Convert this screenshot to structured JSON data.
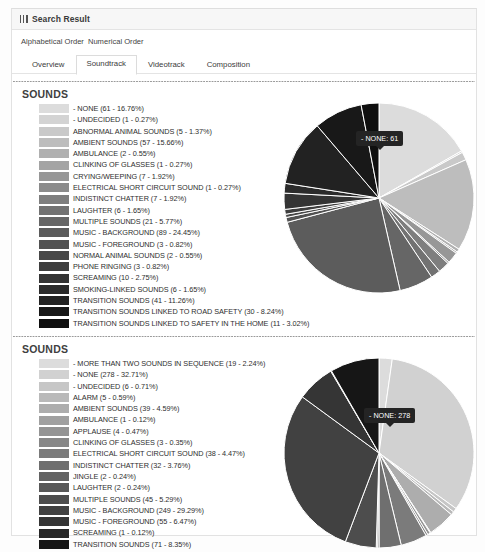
{
  "header": {
    "icon": "grid-icon",
    "title": "Search Result"
  },
  "order_options": [
    {
      "label": "Alphabetical Order"
    },
    {
      "label": "Numerical Order"
    }
  ],
  "tabs": [
    {
      "label": "Overview",
      "active": false
    },
    {
      "label": "Soundtrack",
      "active": true
    },
    {
      "label": "Videotrack",
      "active": false
    },
    {
      "label": "Composition",
      "active": false
    }
  ],
  "sections": [
    {
      "title": "SOUNDS",
      "tooltip": "- NONE: 61",
      "chart_data": {
        "type": "pie",
        "title": "SOUNDS",
        "legend_position": "left",
        "total": 364,
        "categories": [
          "- NONE",
          "- UNDECIDED",
          "ABNORMAL ANIMAL SOUNDS",
          "AMBIENT SOUNDS",
          "AMBULANCE",
          "CLINKING OF GLASSES",
          "CRYING/WEEPING",
          "ELECTRICAL SHORT CIRCUIT SOUND",
          "INDISTINCT CHATTER",
          "LAUGHTER",
          "MULTIPLE SOUNDS",
          "MUSIC - BACKGROUND",
          "MUSIC - FOREGROUND",
          "NORMAL ANIMAL SOUNDS",
          "PHONE RINGING",
          "SCREAMING",
          "SMOKING-LINKED SOUNDS",
          "TRANSITION SOUNDS",
          "TRANSITION SOUNDS LINKED TO ROAD SAFETY",
          "TRANSITION SOUNDS LINKED TO SAFETY IN THE HOME"
        ],
        "values": [
          61,
          1,
          5,
          57,
          2,
          1,
          7,
          1,
          7,
          6,
          21,
          89,
          3,
          2,
          3,
          10,
          6,
          41,
          30,
          11
        ],
        "percents": [
          16.76,
          0.27,
          1.37,
          15.66,
          0.55,
          0.27,
          1.92,
          0.27,
          1.92,
          1.65,
          5.77,
          24.45,
          0.82,
          0.55,
          0.82,
          2.75,
          1.65,
          11.26,
          8.24,
          3.02
        ],
        "colors": [
          "#dcdcdc",
          "#d3d3d3",
          "#c9c9c9",
          "#bdbdbd",
          "#b0b0b0",
          "#a4a4a4",
          "#979797",
          "#8b8b8b",
          "#7e7e7e",
          "#727272",
          "#666666",
          "#5c5c5c",
          "#525252",
          "#484848",
          "#3e3e3e",
          "#343434",
          "#2b2b2b",
          "#222222",
          "#181818",
          "#0f0f0f"
        ]
      },
      "legend": [
        {
          "label": "- NONE (61 - 16.76%)",
          "color": "#dcdcdc"
        },
        {
          "label": "- UNDECIDED (1 - 0.27%)",
          "color": "#d3d3d3"
        },
        {
          "label": "ABNORMAL ANIMAL SOUNDS (5 - 1.37%)",
          "color": "#c9c9c9"
        },
        {
          "label": "AMBIENT SOUNDS (57 - 15.66%)",
          "color": "#bdbdbd"
        },
        {
          "label": "AMBULANCE (2 - 0.55%)",
          "color": "#b0b0b0"
        },
        {
          "label": "CLINKING OF GLASSES (1 - 0.27%)",
          "color": "#a4a4a4"
        },
        {
          "label": "CRYING/WEEPING (7 - 1.92%)",
          "color": "#979797"
        },
        {
          "label": "ELECTRICAL SHORT CIRCUIT SOUND (1 - 0.27%)",
          "color": "#8b8b8b"
        },
        {
          "label": "INDISTINCT CHATTER (7 - 1.92%)",
          "color": "#7e7e7e"
        },
        {
          "label": "LAUGHTER (6 - 1.65%)",
          "color": "#727272"
        },
        {
          "label": "MULTIPLE SOUNDS (21 - 5.77%)",
          "color": "#666666"
        },
        {
          "label": "MUSIC - BACKGROUND (89 - 24.45%)",
          "color": "#5c5c5c"
        },
        {
          "label": "MUSIC - FOREGROUND (3 - 0.82%)",
          "color": "#525252"
        },
        {
          "label": "NORMAL ANIMAL SOUNDS (2 - 0.55%)",
          "color": "#484848"
        },
        {
          "label": "PHONE RINGING (3 - 0.82%)",
          "color": "#3e3e3e"
        },
        {
          "label": "SCREAMING (10 - 2.75%)",
          "color": "#343434"
        },
        {
          "label": "SMOKING-LINKED SOUNDS (6 - 1.65%)",
          "color": "#2b2b2b"
        },
        {
          "label": "TRANSITION SOUNDS (41 - 11.26%)",
          "color": "#222222"
        },
        {
          "label": "TRANSITION SOUNDS LINKED TO ROAD SAFETY (30 - 8.24%)",
          "color": "#181818"
        },
        {
          "label": "TRANSITION SOUNDS LINKED TO SAFETY IN THE HOME (11 - 3.02%)",
          "color": "#0f0f0f"
        }
      ]
    },
    {
      "title": "SOUNDS",
      "tooltip": "- NONE: 278",
      "chart_data": {
        "type": "pie",
        "title": "SOUNDS",
        "legend_position": "left",
        "total": 850,
        "categories": [
          "- MORE THAN TWO SOUNDS IN SEQUENCE",
          "- NONE",
          "- UNDECIDED",
          "ALARM",
          "AMBIENT SOUNDS",
          "AMBULANCE",
          "APPLAUSE",
          "CLINKING OF GLASSES",
          "ELECTRICAL SHORT CIRCUIT SOUND",
          "INDISTINCT CHATTER",
          "JINGLE",
          "LAUGHTER",
          "MULTIPLE SOUNDS",
          "MUSIC - BACKGROUND",
          "MUSIC - FOREGROUND",
          "SCREAMING",
          "TRANSITION SOUNDS"
        ],
        "values": [
          19,
          278,
          6,
          5,
          39,
          1,
          4,
          3,
          38,
          32,
          2,
          2,
          45,
          249,
          55,
          1,
          71
        ],
        "percents": [
          2.24,
          32.71,
          0.71,
          0.59,
          4.59,
          0.12,
          0.47,
          0.35,
          4.47,
          3.76,
          0.24,
          0.24,
          5.29,
          29.29,
          6.47,
          0.12,
          8.35
        ],
        "colors": [
          "#dcdcdc",
          "#d1d1d1",
          "#c6c6c6",
          "#b9b9b9",
          "#adadad",
          "#a0a0a0",
          "#949494",
          "#878787",
          "#7b7b7b",
          "#6f6f6f",
          "#636363",
          "#585858",
          "#4d4d4d",
          "#414141",
          "#353535",
          "#272727",
          "#161616"
        ]
      },
      "legend": [
        {
          "label": "- MORE THAN TWO SOUNDS IN SEQUENCE (19 - 2.24%)",
          "color": "#dcdcdc"
        },
        {
          "label": "- NONE (278 - 32.71%)",
          "color": "#d1d1d1"
        },
        {
          "label": "- UNDECIDED (6 - 0.71%)",
          "color": "#c6c6c6"
        },
        {
          "label": "ALARM (5 - 0.59%)",
          "color": "#b9b9b9"
        },
        {
          "label": "AMBIENT SOUNDS (39 - 4.59%)",
          "color": "#adadad"
        },
        {
          "label": "AMBULANCE (1 - 0.12%)",
          "color": "#a0a0a0"
        },
        {
          "label": "APPLAUSE (4 - 0.47%)",
          "color": "#949494"
        },
        {
          "label": "CLINKING OF GLASSES (3 - 0.35%)",
          "color": "#878787"
        },
        {
          "label": "ELECTRICAL SHORT CIRCUIT SOUND (38 - 4.47%)",
          "color": "#7b7b7b"
        },
        {
          "label": "INDISTINCT CHATTER (32 - 3.76%)",
          "color": "#6f6f6f"
        },
        {
          "label": "JINGLE (2 - 0.24%)",
          "color": "#636363"
        },
        {
          "label": "LAUGHTER (2 - 0.24%)",
          "color": "#585858"
        },
        {
          "label": "MULTIPLE SOUNDS (45 - 5.29%)",
          "color": "#4d4d4d"
        },
        {
          "label": "MUSIC - BACKGROUND (249 - 29.29%)",
          "color": "#414141"
        },
        {
          "label": "MUSIC - FOREGROUND (55 - 6.47%)",
          "color": "#353535"
        },
        {
          "label": "SCREAMING (1 - 0.12%)",
          "color": "#272727"
        },
        {
          "label": "TRANSITION SOUNDS (71 - 8.35%)",
          "color": "#161616"
        }
      ]
    }
  ]
}
